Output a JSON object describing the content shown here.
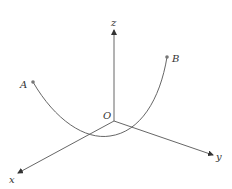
{
  "diagram": {
    "type": "3d-coordinate-axes-with-curve",
    "origin_label": "O",
    "axes": [
      {
        "name": "x",
        "label": "x"
      },
      {
        "name": "y",
        "label": "y"
      },
      {
        "name": "z",
        "label": "z"
      }
    ],
    "points": [
      {
        "name": "A",
        "label": "A"
      },
      {
        "name": "B",
        "label": "B"
      }
    ],
    "curve": {
      "from": "A",
      "to": "B",
      "shape": "parabola-like arc passing below origin"
    },
    "colors": {
      "line": "#555555",
      "text": "#333333",
      "background": "#ffffff"
    }
  }
}
